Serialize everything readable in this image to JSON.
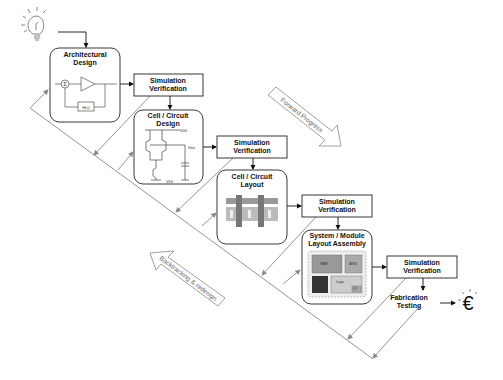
{
  "diagram": {
    "stages": [
      {
        "id": "architectural-design",
        "title_line1": "Architectural",
        "title_line2": "Design"
      },
      {
        "id": "cell-circuit-design",
        "title_line1": "Cell / Circuit",
        "title_line2": "Design"
      },
      {
        "id": "cell-circuit-layout",
        "title_line1": "Cell / Circuit",
        "title_line2": "Layout"
      },
      {
        "id": "system-module-layout",
        "title_line1": "System / Module",
        "title_line2": "Layout Assembly"
      }
    ],
    "verification": {
      "line1": "Simulation",
      "line2": "Verification"
    },
    "fabrication": {
      "line1": "Fabrication",
      "line2": "Testing"
    },
    "arch_block": {
      "sum_symbol": "Σ",
      "feedback": "H(s)"
    },
    "circuit_labels": {
      "vdd": "VDD",
      "vout": "Vout",
      "vss": "VSS"
    },
    "chip_blocks": {
      "ram": "RAM",
      "arm": "ARM",
      "dsp": "DSP",
      "logic": "Logic",
      "io": "I/O"
    },
    "forward_label": "Forward Progress",
    "backtrack_label": "Backtracking & redesign",
    "money_symbol": "€"
  }
}
